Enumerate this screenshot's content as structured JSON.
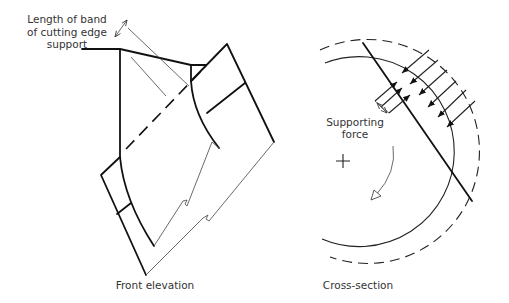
{
  "figure": {
    "front_elevation": {
      "caption": "Front elevation",
      "annotation": {
        "line1": "Length of band",
        "line2": "of cutting edge",
        "line3": "support"
      }
    },
    "cross_section": {
      "caption": "Cross-section",
      "annotation": {
        "line1": "Supporting",
        "line2": "force"
      },
      "center_marker": "+",
      "rotation_direction": "clockwise",
      "applied_force_arrows": 6,
      "supporting_force_arrows": 3
    }
  },
  "colors": {
    "line": "#111111",
    "text": "#333333",
    "background": "#ffffff"
  }
}
